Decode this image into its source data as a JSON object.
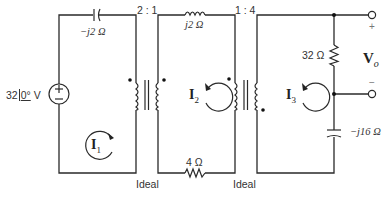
{
  "diagram": {
    "type": "circuit",
    "source": {
      "label": "32/0° V",
      "magnitude": "32",
      "angle": "0°",
      "unit": "V",
      "polarity_top": "+",
      "polarity_bottom": "−"
    },
    "capacitor_1": {
      "label": "−j2 Ω"
    },
    "transformer_1": {
      "ratio": "2 : 1",
      "note": "Ideal"
    },
    "inductor": {
      "label": "j2 Ω"
    },
    "resistor_bottom": {
      "label": "4 Ω"
    },
    "transformer_2": {
      "ratio": "1 : 4",
      "note": "Ideal"
    },
    "resistor_right": {
      "label": "32 Ω"
    },
    "capacitor_2": {
      "label": "−j16 Ω"
    },
    "output": {
      "label": "V",
      "subscript": "o",
      "plus": "+",
      "minus": "−"
    },
    "mesh_currents": [
      {
        "label": "I",
        "subscript": "1"
      },
      {
        "label": "I",
        "subscript": "2"
      },
      {
        "label": "I",
        "subscript": "3"
      }
    ],
    "colors": {
      "wire": "#2a2a2a",
      "text": "#333333",
      "background": "#ffffff"
    }
  }
}
